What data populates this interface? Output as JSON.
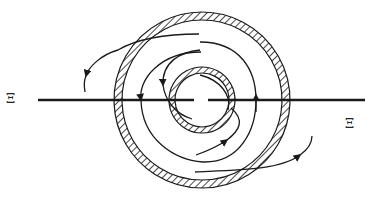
{
  "diagram": {
    "title": "",
    "labels": {
      "left": "Ξ",
      "right": "Ξ"
    },
    "colors": {
      "stroke": "#1a1a1a",
      "background": "#ffffff"
    },
    "elements": {
      "outer_ring": "hatched outer cylinder wall",
      "inner_ring": "hatched inner cylinder wall",
      "axis_line": "horizontal section line Ξ–Ξ",
      "flow_lines": "spiral flow streamlines with arrows"
    }
  }
}
